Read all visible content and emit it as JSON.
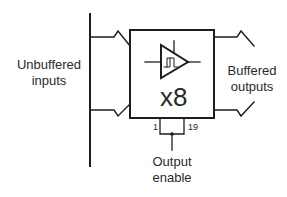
{
  "diagram": {
    "type": "octal buffer block diagram",
    "labels": {
      "inputs_line1": "Unbuffered",
      "inputs_line2": "inputs",
      "outputs_line1": "Buffered",
      "outputs_line2": "outputs",
      "multiplier": "x8",
      "enable_line1": "Output",
      "enable_line2": "enable",
      "pin_left": "1",
      "pin_right": "19"
    },
    "components": [
      {
        "name": "input-bus",
        "kind": "bus line"
      },
      {
        "name": "buffer-block",
        "kind": "box containing schmitt-trigger buffer symbol"
      },
      {
        "name": "schmitt-buffer-symbol",
        "kind": "triangle buffer with hysteresis glyph"
      },
      {
        "name": "output-enable-bracket",
        "kind": "pins 1 and 19 tied together"
      }
    ],
    "colors": {
      "line": "#1e1e1e",
      "text": "#2a2a2a",
      "background": "#ffffff"
    }
  }
}
